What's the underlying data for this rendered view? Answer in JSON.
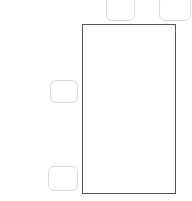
{
  "canvas": {
    "width": 192,
    "height": 201,
    "background_color": "#ffffff"
  },
  "colors": {
    "main_panel_border": "#555555",
    "pill_border": "#d9d9d9",
    "fill": "#ffffff"
  },
  "shapes": {
    "main_panel": {
      "name": "content-panel",
      "label": "",
      "x": 82,
      "y": 24,
      "width": 94,
      "height": 170,
      "border_color": "#555555",
      "fill": "#ffffff",
      "corner": "square"
    },
    "pills": [
      {
        "name": "top-left-button",
        "label": "",
        "x": 106,
        "y": -4,
        "width": 29,
        "height": 25,
        "border_color": "#d9d9d9",
        "fill": "#ffffff",
        "corner": "rounded",
        "clipped_edge": "top"
      },
      {
        "name": "top-right-button",
        "label": "",
        "x": 159,
        "y": -4,
        "width": 32,
        "height": 25,
        "border_color": "#d9d9d9",
        "fill": "#ffffff",
        "corner": "rounded",
        "clipped_edge": "top"
      },
      {
        "name": "left-middle-button",
        "label": "",
        "x": 50,
        "y": 80,
        "width": 28,
        "height": 23,
        "border_color": "#d9d9d9",
        "fill": "#ffffff",
        "corner": "rounded",
        "clipped_edge": "none"
      },
      {
        "name": "left-bottom-button",
        "label": "",
        "x": 48,
        "y": 166,
        "width": 30,
        "height": 25,
        "border_color": "#d9d9d9",
        "fill": "#ffffff",
        "corner": "rounded",
        "clipped_edge": "none"
      }
    ]
  }
}
